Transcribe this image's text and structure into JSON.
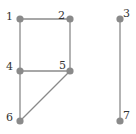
{
  "graph": {
    "colors": {
      "edge": "#8a8a8a",
      "node": "#8a8a8a",
      "label": "#333333",
      "background": "#ffffff"
    },
    "nodes": [
      {
        "id": "1",
        "label": "1",
        "x": 20,
        "y": 19,
        "lx": 6,
        "ly": 20
      },
      {
        "id": "2",
        "label": "2",
        "x": 70,
        "y": 19,
        "lx": 58,
        "ly": 19
      },
      {
        "id": "3",
        "label": "3",
        "x": 120,
        "y": 19,
        "lx": 123,
        "ly": 17
      },
      {
        "id": "4",
        "label": "4",
        "x": 20,
        "y": 71,
        "lx": 6,
        "ly": 70
      },
      {
        "id": "5",
        "label": "5",
        "x": 70,
        "y": 71,
        "lx": 59,
        "ly": 69
      },
      {
        "id": "6",
        "label": "6",
        "x": 20,
        "y": 121,
        "lx": 6,
        "ly": 121
      },
      {
        "id": "7",
        "label": "7",
        "x": 120,
        "y": 121,
        "lx": 123,
        "ly": 119
      }
    ],
    "edges": [
      {
        "from": "1",
        "to": "2"
      },
      {
        "from": "1",
        "to": "4"
      },
      {
        "from": "2",
        "to": "5"
      },
      {
        "from": "4",
        "to": "5"
      },
      {
        "from": "4",
        "to": "6"
      },
      {
        "from": "5",
        "to": "6"
      },
      {
        "from": "3",
        "to": "7"
      }
    ]
  }
}
